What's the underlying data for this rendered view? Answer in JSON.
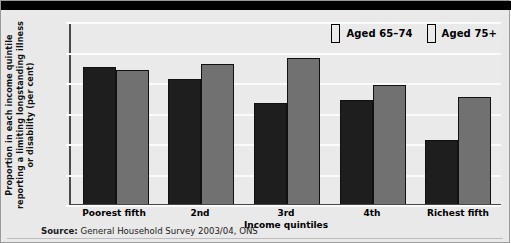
{
  "chart_data": {
    "type": "bar",
    "title": "",
    "xlabel": "Income quintiles",
    "ylabel": "Proportion in each income quintile reporting a limiting longstanding illness or disability (per cent)",
    "categories": [
      "Poorest fifth",
      "2nd",
      "3rd",
      "4th",
      "Richest fifth"
    ],
    "series": [
      {
        "name": "Aged 65–74",
        "color": "#1e1e1e",
        "values": [
          45,
          41,
          33,
          34,
          21
        ]
      },
      {
        "name": "Aged 75+",
        "color": "#717171",
        "values": [
          44,
          46,
          48,
          39,
          35
        ]
      }
    ],
    "ylim": [
      0,
      60
    ],
    "yticks": [
      0,
      10,
      20,
      30,
      40,
      50,
      60
    ],
    "ytick_labels": [
      "0",
      "10",
      "20",
      "30",
      "40",
      "50",
      "60"
    ],
    "grid": true,
    "legend_position": "top-right"
  },
  "source": {
    "prefix": "Source:",
    "text": "General Household Survey 2003/04, ONS"
  }
}
